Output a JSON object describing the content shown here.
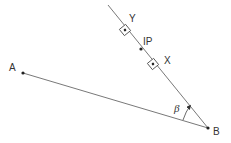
{
  "diagram": {
    "type": "geometry",
    "points": {
      "A": {
        "label": "A",
        "x": 23,
        "y": 73
      },
      "B": {
        "label": "B",
        "x": 208,
        "y": 128
      },
      "IP": {
        "label": "IP",
        "x": 141,
        "y": 49
      },
      "X": {
        "label": "X",
        "x": 153,
        "y": 64
      },
      "Y": {
        "label": "Y",
        "x": 125,
        "y": 30
      }
    },
    "angle": {
      "label": "β",
      "vertex": "B"
    },
    "colors": {
      "line": "#555555",
      "text": "#333333"
    }
  }
}
